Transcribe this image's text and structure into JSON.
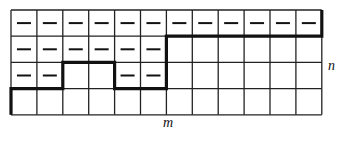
{
  "diagram": {
    "columns": 12,
    "rows": 4,
    "grid_origin": [
      11,
      10
    ],
    "cell_width": 25.9,
    "cell_height": 26.2,
    "cells_with_dash": [
      [
        0,
        0
      ],
      [
        0,
        1
      ],
      [
        0,
        2
      ],
      [
        0,
        3
      ],
      [
        0,
        4
      ],
      [
        0,
        5
      ],
      [
        0,
        6
      ],
      [
        0,
        7
      ],
      [
        0,
        8
      ],
      [
        0,
        9
      ],
      [
        0,
        10
      ],
      [
        0,
        11
      ],
      [
        1,
        0
      ],
      [
        1,
        1
      ],
      [
        1,
        2
      ],
      [
        1,
        3
      ],
      [
        1,
        4
      ],
      [
        1,
        5
      ],
      [
        2,
        0
      ],
      [
        2,
        1
      ],
      [
        2,
        4
      ],
      [
        2,
        5
      ]
    ],
    "dash_symbol": "—",
    "path_vertices": [
      [
        0,
        4
      ],
      [
        0,
        3
      ],
      [
        2,
        3
      ],
      [
        2,
        2
      ],
      [
        4,
        2
      ],
      [
        4,
        3
      ],
      [
        6,
        3
      ],
      [
        6,
        1
      ],
      [
        12,
        1
      ],
      [
        12,
        0
      ]
    ],
    "labels": {
      "m": "m",
      "n": "n"
    },
    "colors": {
      "grid": "#222222",
      "path": "#111111",
      "dash": "#111111"
    }
  }
}
